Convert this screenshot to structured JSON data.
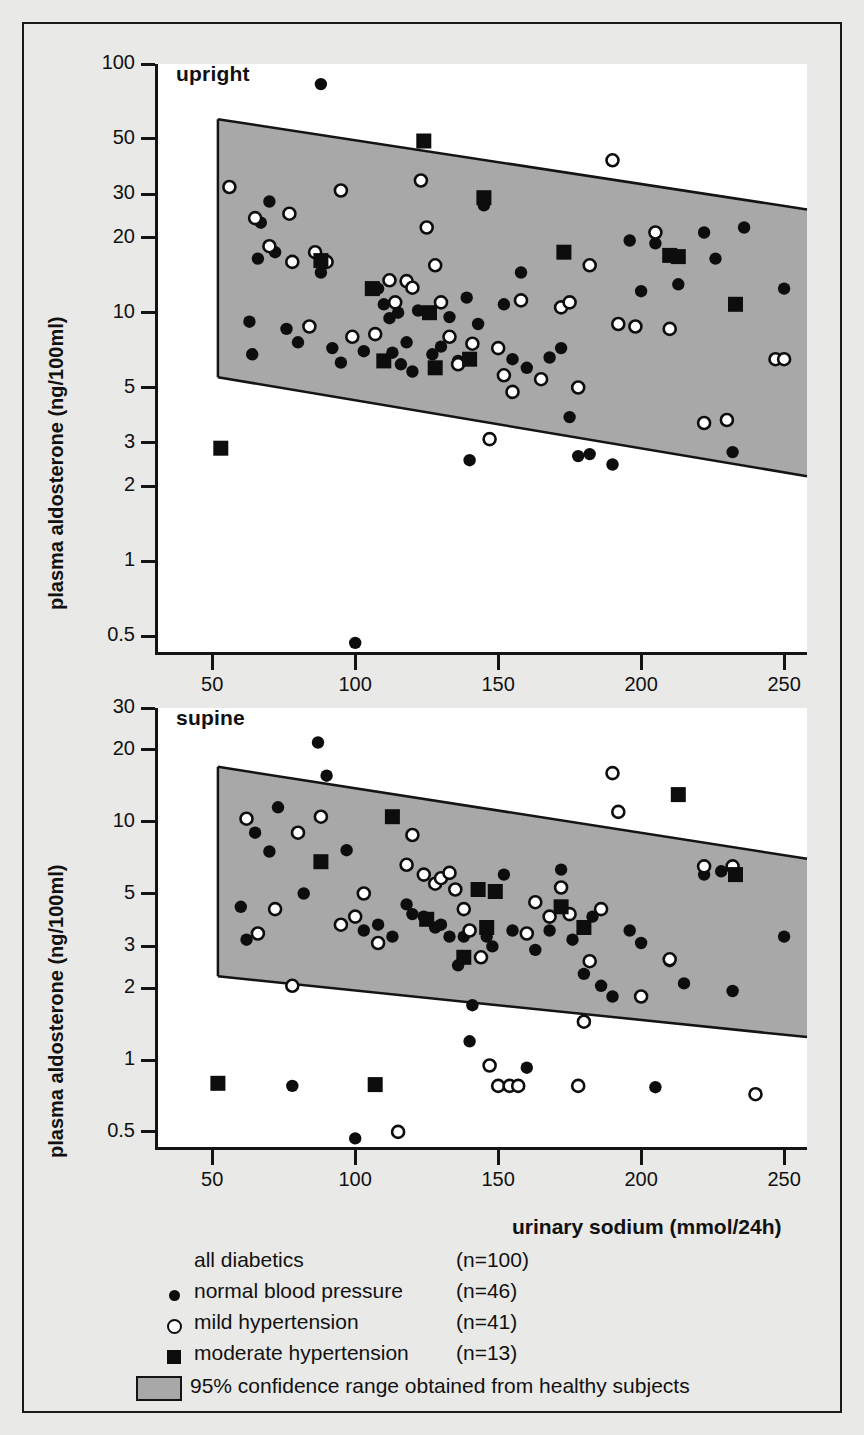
{
  "figure": {
    "background": "#e9e9e7",
    "band_fill": "#a8a8a8",
    "ink": "#141414"
  },
  "axis_titles": {
    "y": "plasma aldosterone (ng/100ml)",
    "x": "urinary sodium (mmol/24h)"
  },
  "legend": {
    "rows": [
      {
        "symbol": "none",
        "label": "all diabetics",
        "n": "(n=100)"
      },
      {
        "symbol": "dot",
        "label": "normal blood pressure",
        "n": "(n=46)"
      },
      {
        "symbol": "circle",
        "label": "mild hypertension",
        "n": "(n=41)"
      },
      {
        "symbol": "square",
        "label": "moderate hypertension",
        "n": "(n=13)"
      }
    ],
    "band_label": "95% confidence range obtained from healthy subjects"
  },
  "chart_data": [
    {
      "type": "scatter",
      "title": "upright",
      "xlabel": "urinary sodium (mmol/24h)",
      "ylabel": "plasma aldosterone (ng/100ml)",
      "xscale": "linear",
      "yscale": "log",
      "xlim": [
        30,
        258
      ],
      "ylim": [
        0.42,
        100
      ],
      "xticks": [
        50,
        100,
        150,
        200,
        250
      ],
      "yticks": [
        100,
        50,
        30,
        20,
        10,
        5,
        3,
        2,
        1,
        0.5
      ],
      "ytick_labels": [
        "100",
        "50",
        "30",
        "20",
        "10",
        "5",
        "3",
        "2",
        "1",
        "0.5"
      ],
      "grid": false,
      "confidence_band": {
        "label": "95% confidence range obtained from healthy subjects",
        "x": [
          52,
          258
        ],
        "upper": [
          60,
          26
        ],
        "lower": [
          5.5,
          2.2
        ]
      },
      "series": [
        {
          "name": "normal blood pressure",
          "marker": "filled-circle",
          "points": [
            [
              63,
              9.2
            ],
            [
              64,
              6.8
            ],
            [
              67,
              23
            ],
            [
              70,
              28
            ],
            [
              66,
              16.5
            ],
            [
              72,
              17.5
            ],
            [
              76,
              8.6
            ],
            [
              80,
              7.6
            ],
            [
              88,
              83
            ],
            [
              88,
              14.5
            ],
            [
              92,
              7.2
            ],
            [
              95,
              6.3
            ],
            [
              100,
              0.47
            ],
            [
              103,
              7.0
            ],
            [
              108,
              12.5
            ],
            [
              110,
              10.8
            ],
            [
              112,
              9.5
            ],
            [
              115,
              10.0
            ],
            [
              118,
              7.6
            ],
            [
              113,
              6.9
            ],
            [
              116,
              6.2
            ],
            [
              120,
              5.8
            ],
            [
              122,
              10.2
            ],
            [
              125,
              10.0
            ],
            [
              127,
              6.8
            ],
            [
              130,
              7.3
            ],
            [
              133,
              9.6
            ],
            [
              136,
              6.4
            ],
            [
              139,
              11.5
            ],
            [
              143,
              9.0
            ],
            [
              140,
              2.55
            ],
            [
              145,
              27
            ],
            [
              152,
              10.8
            ],
            [
              155,
              6.5
            ],
            [
              158,
              14.5
            ],
            [
              160,
              6.0
            ],
            [
              168,
              6.6
            ],
            [
              172,
              7.2
            ],
            [
              175,
              3.8
            ],
            [
              178,
              2.65
            ],
            [
              182,
              2.7
            ],
            [
              190,
              2.45
            ],
            [
              196,
              19.5
            ],
            [
              200,
              12.2
            ],
            [
              205,
              19.0
            ],
            [
              213,
              13.0
            ],
            [
              222,
              21
            ],
            [
              226,
              16.5
            ],
            [
              232,
              2.75
            ],
            [
              236,
              22
            ],
            [
              250,
              12.5
            ]
          ]
        },
        {
          "name": "mild hypertension",
          "marker": "open-circle",
          "points": [
            [
              56,
              32
            ],
            [
              65,
              24
            ],
            [
              70,
              18.5
            ],
            [
              77,
              25
            ],
            [
              78,
              16.0
            ],
            [
              86,
              17.5
            ],
            [
              84,
              8.8
            ],
            [
              90,
              16.0
            ],
            [
              95,
              31
            ],
            [
              99,
              8.0
            ],
            [
              107,
              8.2
            ],
            [
              112,
              13.5
            ],
            [
              114,
              11.0
            ],
            [
              118,
              13.4
            ],
            [
              120,
              12.6
            ],
            [
              123,
              34
            ],
            [
              125,
              22
            ],
            [
              128,
              15.5
            ],
            [
              130,
              11.0
            ],
            [
              133,
              8.0
            ],
            [
              136,
              6.2
            ],
            [
              141,
              7.5
            ],
            [
              147,
              3.1
            ],
            [
              150,
              7.2
            ],
            [
              152,
              5.6
            ],
            [
              155,
              4.8
            ],
            [
              158,
              11.2
            ],
            [
              165,
              5.4
            ],
            [
              172,
              10.5
            ],
            [
              175,
              11.0
            ],
            [
              178,
              5.0
            ],
            [
              182,
              15.5
            ],
            [
              190,
              41
            ],
            [
              192,
              9.0
            ],
            [
              198,
              8.8
            ],
            [
              205,
              21
            ],
            [
              210,
              8.6
            ],
            [
              222,
              3.6
            ],
            [
              230,
              3.7
            ],
            [
              247,
              6.5
            ],
            [
              250,
              6.5
            ]
          ]
        },
        {
          "name": "moderate hypertension",
          "marker": "filled-square",
          "points": [
            [
              53,
              2.85
            ],
            [
              88,
              16.2
            ],
            [
              106,
              12.5
            ],
            [
              110,
              6.4
            ],
            [
              124,
              49
            ],
            [
              126,
              10.0
            ],
            [
              128,
              6.0
            ],
            [
              140,
              6.5
            ],
            [
              145,
              29
            ],
            [
              173,
              17.5
            ],
            [
              210,
              17.0
            ],
            [
              213,
              16.8
            ],
            [
              233,
              10.8
            ]
          ]
        }
      ]
    },
    {
      "type": "scatter",
      "title": "supine",
      "xlabel": "urinary sodium (mmol/24h)",
      "ylabel": "plasma aldosterone (ng/100ml)",
      "xscale": "linear",
      "yscale": "log",
      "xlim": [
        30,
        258
      ],
      "ylim": [
        0.42,
        30
      ],
      "xticks": [
        50,
        100,
        150,
        200,
        250
      ],
      "yticks": [
        30,
        20,
        10,
        5,
        3,
        2,
        1,
        0.5
      ],
      "ytick_labels": [
        "30",
        "20",
        "10",
        "5",
        "3",
        "2",
        "1",
        "0.5"
      ],
      "grid": false,
      "confidence_band": {
        "label": "95% confidence range obtained from healthy subjects",
        "x": [
          52,
          258
        ],
        "upper": [
          17,
          7.0
        ],
        "lower": [
          2.25,
          1.25
        ]
      },
      "series": [
        {
          "name": "normal blood pressure",
          "marker": "filled-circle",
          "points": [
            [
              60,
              4.4
            ],
            [
              62,
              3.2
            ],
            [
              65,
              9.0
            ],
            [
              70,
              7.5
            ],
            [
              73,
              11.5
            ],
            [
              78,
              0.78
            ],
            [
              82,
              5.0
            ],
            [
              87,
              21.5
            ],
            [
              90,
              15.6
            ],
            [
              97,
              7.6
            ],
            [
              100,
              0.47
            ],
            [
              103,
              3.5
            ],
            [
              108,
              3.7
            ],
            [
              113,
              3.3
            ],
            [
              118,
              4.5
            ],
            [
              120,
              4.1
            ],
            [
              124,
              4.0
            ],
            [
              128,
              3.6
            ],
            [
              130,
              3.7
            ],
            [
              133,
              3.3
            ],
            [
              136,
              2.5
            ],
            [
              138,
              3.3
            ],
            [
              140,
              1.2
            ],
            [
              141,
              1.7
            ],
            [
              146,
              3.3
            ],
            [
              148,
              3.0
            ],
            [
              152,
              6.0
            ],
            [
              155,
              3.5
            ],
            [
              160,
              0.93
            ],
            [
              163,
              2.9
            ],
            [
              168,
              3.5
            ],
            [
              172,
              6.3
            ],
            [
              176,
              3.2
            ],
            [
              180,
              2.3
            ],
            [
              183,
              4.0
            ],
            [
              186,
              2.05
            ],
            [
              190,
              1.85
            ],
            [
              196,
              3.5
            ],
            [
              200,
              3.1
            ],
            [
              205,
              0.77
            ],
            [
              210,
              2.6
            ],
            [
              215,
              2.1
            ],
            [
              222,
              6.0
            ],
            [
              228,
              6.2
            ],
            [
              232,
              1.95
            ],
            [
              250,
              3.3
            ]
          ]
        },
        {
          "name": "mild hypertension",
          "marker": "open-circle",
          "points": [
            [
              62,
              10.3
            ],
            [
              66,
              3.4
            ],
            [
              72,
              4.3
            ],
            [
              78,
              2.05
            ],
            [
              80,
              9.0
            ],
            [
              88,
              10.5
            ],
            [
              95,
              3.7
            ],
            [
              100,
              4.0
            ],
            [
              103,
              5.0
            ],
            [
              108,
              3.1
            ],
            [
              115,
              0.5
            ],
            [
              118,
              6.6
            ],
            [
              120,
              8.8
            ],
            [
              124,
              6.0
            ],
            [
              128,
              5.5
            ],
            [
              130,
              5.8
            ],
            [
              133,
              6.1
            ],
            [
              135,
              5.2
            ],
            [
              138,
              4.3
            ],
            [
              140,
              3.5
            ],
            [
              144,
              2.7
            ],
            [
              147,
              0.95
            ],
            [
              150,
              0.78
            ],
            [
              154,
              0.78
            ],
            [
              157,
              0.78
            ],
            [
              160,
              3.4
            ],
            [
              163,
              4.6
            ],
            [
              168,
              4.0
            ],
            [
              172,
              5.3
            ],
            [
              175,
              4.1
            ],
            [
              178,
              0.78
            ],
            [
              180,
              1.45
            ],
            [
              182,
              2.6
            ],
            [
              186,
              4.3
            ],
            [
              190,
              16.0
            ],
            [
              192,
              11.0
            ],
            [
              200,
              1.85
            ],
            [
              210,
              2.65
            ],
            [
              222,
              6.5
            ],
            [
              232,
              6.5
            ],
            [
              240,
              0.72
            ]
          ]
        },
        {
          "name": "moderate hypertension",
          "marker": "filled-square",
          "points": [
            [
              52,
              0.8
            ],
            [
              88,
              6.8
            ],
            [
              107,
              0.79
            ],
            [
              113,
              10.5
            ],
            [
              125,
              3.9
            ],
            [
              138,
              2.7
            ],
            [
              143,
              5.2
            ],
            [
              146,
              3.6
            ],
            [
              149,
              5.1
            ],
            [
              172,
              4.4
            ],
            [
              180,
              3.6
            ],
            [
              213,
              13.0
            ],
            [
              233,
              6.0
            ]
          ]
        }
      ]
    }
  ]
}
